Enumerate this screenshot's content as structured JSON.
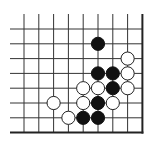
{
  "board": {
    "description": "Go board corner diagram (lower-right corner)",
    "origin_x": 24,
    "origin_y": 29,
    "spacing": 14.8,
    "cols": 9,
    "rows": 8,
    "line_left": 10,
    "line_top": 14,
    "right_edge_col": 8,
    "bottom_edge_row": 7,
    "colors": {
      "line": "#333333",
      "black": "#111111",
      "white": "#ffffff"
    },
    "stone_radius": 6.6
  },
  "stones": [
    {
      "color": "black",
      "col": 5,
      "row": 1
    },
    {
      "color": "white",
      "col": 7,
      "row": 2
    },
    {
      "color": "black",
      "col": 5,
      "row": 3
    },
    {
      "color": "black",
      "col": 6,
      "row": 3
    },
    {
      "color": "white",
      "col": 7,
      "row": 3
    },
    {
      "color": "white",
      "col": 4,
      "row": 4
    },
    {
      "color": "white",
      "col": 5,
      "row": 4
    },
    {
      "color": "black",
      "col": 6,
      "row": 4
    },
    {
      "color": "white",
      "col": 7,
      "row": 4
    },
    {
      "color": "white",
      "col": 2,
      "row": 5
    },
    {
      "color": "white",
      "col": 4,
      "row": 5
    },
    {
      "color": "black",
      "col": 5,
      "row": 5
    },
    {
      "color": "white",
      "col": 6,
      "row": 5
    },
    {
      "color": "white",
      "col": 3,
      "row": 6
    },
    {
      "color": "black",
      "col": 4,
      "row": 6
    },
    {
      "color": "black",
      "col": 5,
      "row": 6
    }
  ]
}
